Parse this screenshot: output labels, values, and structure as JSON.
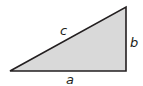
{
  "diagram": {
    "type": "right-triangle",
    "fill_color": "#d9d9d9",
    "stroke_color": "#231f20",
    "vertices": {
      "left": [
        10,
        71
      ],
      "right_angle": [
        126,
        71
      ],
      "top": [
        126,
        7
      ]
    },
    "labels": {
      "hypotenuse": "c",
      "vertical_leg": "b",
      "horizontal_leg": "a"
    }
  }
}
